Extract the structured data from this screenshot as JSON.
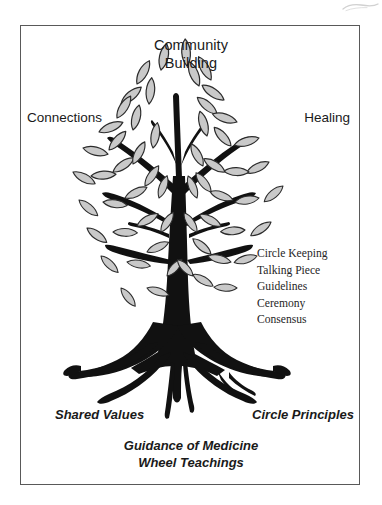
{
  "figure": {
    "type": "diagram",
    "background_color": "#ffffff",
    "border_color": "#595959"
  },
  "canopy": {
    "top_label": "Community\nBuilding",
    "left_label": "Connections",
    "right_label": "Healing"
  },
  "branches_list": {
    "items": [
      "Circle Keeping",
      "Talking Piece",
      "Guidelines",
      "Ceremony",
      "Consensus"
    ]
  },
  "roots": {
    "left_label": "Shared Values",
    "right_label": "Circle Principles",
    "bottom_label": "Guidance of Medicine\nWheel Teachings"
  },
  "artwork": {
    "trunk_color": "#111111",
    "leaf_fill": "#c9c9c9",
    "leaf_stroke": "#2b2b2b",
    "scan_mark_color": "#9a9a9a"
  }
}
